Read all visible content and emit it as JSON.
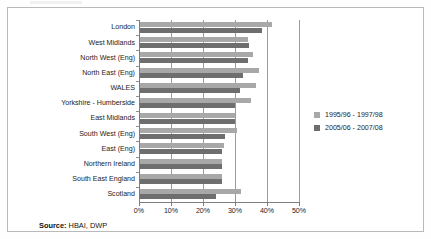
{
  "source_note": {
    "label": "Source:",
    "value": " HBAI, DWP"
  },
  "chart_data": {
    "type": "bar",
    "orientation": "horizontal",
    "title": "",
    "subtitle": "",
    "xlabel": "",
    "ylabel": "",
    "xlim": [
      0,
      50
    ],
    "xticks": [
      0,
      10,
      20,
      30,
      40,
      50
    ],
    "xtick_labels": [
      "0%",
      "10%",
      "20%",
      "30%",
      "40%",
      "50%"
    ],
    "grid": true,
    "grid_axis": "x",
    "legend_position": "right",
    "categories": [
      "London",
      "West Midlands",
      "North West (Eng)",
      "North East (Eng)",
      "WALES",
      "Yorkshire - Humberside",
      "East Midlands",
      "South West (Eng)",
      "East (Eng)",
      "Northern Ireland",
      "South East England",
      "Scotland"
    ],
    "series": [
      {
        "name": "1995/96 - 1997/98",
        "color": "#a8a8a8",
        "values": [
          41.5,
          34.0,
          35.5,
          37.5,
          36.5,
          35.0,
          30.0,
          30.7,
          26.5,
          25.8,
          25.8,
          32.0
        ]
      },
      {
        "name": "2005/06 - 2007/08",
        "color": "#6e6e6e",
        "values": [
          38.5,
          34.5,
          34.0,
          32.5,
          31.5,
          30.0,
          30.0,
          27.0,
          25.8,
          25.8,
          25.8,
          24.0
        ]
      }
    ]
  }
}
